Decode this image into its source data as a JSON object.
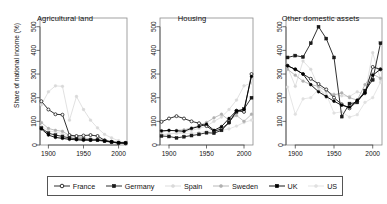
{
  "figure": {
    "ylabel": "Share of national income (%)",
    "y_ticks": [
      "0",
      "100",
      "200",
      "300",
      "400",
      "500"
    ],
    "x_ticks": [
      "1900",
      "1950",
      "2000"
    ],
    "background": "#ffffff"
  },
  "legend": {
    "items": [
      {
        "label": "France",
        "marker": "open-circle",
        "color": "#1a1a1a",
        "key_name": "legend-key-france"
      },
      {
        "label": "Germany",
        "marker": "filled-square",
        "color": "#1a1a1a",
        "key_name": "legend-key-germany"
      },
      {
        "label": "Spain",
        "marker": "filled-circle",
        "color": "#d9d9d9",
        "key_name": "legend-key-spain"
      },
      {
        "label": "Sweden",
        "marker": "filled-circle",
        "color": "#b0b0b0",
        "key_name": "legend-key-sweden"
      },
      {
        "label": "UK",
        "marker": "filled-square",
        "color": "#000000",
        "key_name": "legend-key-uk"
      },
      {
        "label": "US",
        "marker": "filled-circle",
        "color": "#e0e0e0",
        "key_name": "legend-key-us"
      }
    ]
  },
  "chart_data": {
    "type": "line",
    "xlabel": "",
    "ylabel": "Share of national income (%)",
    "xlim": [
      1888,
      2012
    ],
    "ylim": [
      0,
      520
    ],
    "xticks": [
      1900,
      1950,
      2000
    ],
    "yticks": [
      0,
      100,
      200,
      300,
      400,
      500
    ],
    "grid": false,
    "legend_position": "bottom",
    "panels": [
      {
        "title": "Agricultural land",
        "series": [
          {
            "name": "France",
            "color": "#1a1a1a",
            "marker": "open-circle",
            "x": [
              1890,
              1900,
              1910,
              1920,
              1930,
              1940,
              1950,
              1960,
              1970,
              1980,
              1990,
              2000,
              2010
            ],
            "y": [
              185,
              150,
              130,
              128,
              42,
              38,
              40,
              42,
              38,
              20,
              12,
              8,
              7
            ]
          },
          {
            "name": "Germany",
            "color": "#1a1a1a",
            "marker": "filled-square",
            "x": [
              1890,
              1900,
              1910,
              1920,
              1930,
              1940,
              1950,
              1960,
              1970,
              1980,
              1990,
              2000,
              2010
            ],
            "y": [
              72,
              50,
              42,
              36,
              30,
              26,
              24,
              22,
              20,
              16,
              12,
              9,
              8
            ]
          },
          {
            "name": "Spain",
            "color": "#d9d9d9",
            "marker": "filled-circle",
            "x": [
              1890,
              1900,
              1910,
              1920,
              1930,
              1940,
              1950,
              1960,
              1970,
              1980,
              1990,
              2000,
              2010
            ],
            "y": [
              170,
              225,
              250,
              248,
              105,
              205,
              150,
              105,
              72,
              45,
              30,
              18,
              12
            ]
          },
          {
            "name": "Sweden",
            "color": "#b0b0b0",
            "marker": "filled-circle",
            "x": [
              1890,
              1900,
              1910,
              1920,
              1930,
              1940,
              1950,
              1960,
              1970,
              1980,
              1990,
              2000,
              2010
            ],
            "y": [
              95,
              70,
              62,
              58,
              40,
              34,
              30,
              26,
              22,
              18,
              14,
              10,
              9
            ]
          },
          {
            "name": "UK",
            "color": "#000000",
            "marker": "filled-circle",
            "x": [
              1890,
              1900,
              1910,
              1920,
              1930,
              1940,
              1950,
              1960,
              1970,
              1980,
              1990,
              2000,
              2010
            ],
            "y": [
              68,
              42,
              32,
              28,
              24,
              22,
              20,
              20,
              22,
              18,
              14,
              10,
              9
            ]
          },
          {
            "name": "US",
            "color": "#e0e0e0",
            "marker": "filled-circle",
            "x": [
              1890,
              1900,
              1910,
              1920,
              1930,
              1940,
              1950,
              1960,
              1970,
              1980,
              1990,
              2000,
              2010
            ],
            "y": [
              80,
              60,
              55,
              48,
              36,
              30,
              28,
              26,
              24,
              22,
              16,
              12,
              10
            ]
          }
        ]
      },
      {
        "title": "Housing",
        "series": [
          {
            "name": "France",
            "color": "#1a1a1a",
            "marker": "open-circle",
            "x": [
              1890,
              1900,
              1910,
              1920,
              1930,
              1940,
              1950,
              1960,
              1970,
              1980,
              1990,
              2000,
              2010
            ],
            "y": [
              98,
              112,
              122,
              112,
              100,
              92,
              80,
              58,
              68,
              95,
              145,
              140,
              300
            ]
          },
          {
            "name": "Germany",
            "color": "#1a1a1a",
            "marker": "filled-square",
            "x": [
              1890,
              1900,
              1910,
              1920,
              1930,
              1940,
              1950,
              1960,
              1970,
              1980,
              1990,
              2000,
              2010
            ],
            "y": [
              38,
              36,
              30,
              35,
              40,
              45,
              52,
              50,
              62,
              95,
              140,
              152,
              200
            ]
          },
          {
            "name": "Spain",
            "color": "#d9d9d9",
            "marker": "filled-circle",
            "x": [
              1890,
              1900,
              1910,
              1920,
              1930,
              1940,
              1950,
              1960,
              1970,
              1980,
              1990,
              2000,
              2010
            ],
            "y": [
              42,
              46,
              50,
              55,
              62,
              70,
              80,
              100,
              118,
              150,
              190,
              250,
              262
            ]
          },
          {
            "name": "Sweden",
            "color": "#b0b0b0",
            "marker": "filled-circle",
            "x": [
              1890,
              1900,
              1910,
              1920,
              1930,
              1940,
              1950,
              1960,
              1970,
              1980,
              1990,
              2000,
              2010
            ],
            "y": [
              55,
              60,
              62,
              64,
              72,
              82,
              95,
              115,
              130,
              105,
              125,
              100,
              130
            ]
          },
          {
            "name": "UK",
            "color": "#000000",
            "marker": "filled-circle",
            "x": [
              1890,
              1900,
              1910,
              1920,
              1930,
              1940,
              1950,
              1960,
              1970,
              1980,
              1990,
              2000,
              2010
            ],
            "y": [
              60,
              62,
              60,
              58,
              70,
              78,
              88,
              62,
              78,
              112,
              145,
              150,
              290
            ]
          },
          {
            "name": "US",
            "color": "#e0e0e0",
            "marker": "filled-circle",
            "x": [
              1890,
              1900,
              1910,
              1920,
              1930,
              1940,
              1950,
              1960,
              1970,
              1980,
              1990,
              2000,
              2010
            ],
            "y": [
              45,
              48,
              50,
              48,
              50,
              52,
              58,
              60,
              62,
              68,
              80,
              95,
              105
            ]
          }
        ]
      },
      {
        "title": "Other domestic assets",
        "series": [
          {
            "name": "France",
            "color": "#1a1a1a",
            "marker": "open-circle",
            "x": [
              1890,
              1900,
              1910,
              1920,
              1930,
              1940,
              1950,
              1960,
              1970,
              1980,
              1990,
              2000,
              2010
            ],
            "y": [
              335,
              320,
              300,
              280,
              258,
              235,
              200,
              172,
              155,
              185,
              220,
              330,
              320
            ]
          },
          {
            "name": "Germany",
            "color": "#1a1a1a",
            "marker": "filled-square",
            "x": [
              1890,
              1900,
              1910,
              1920,
              1930,
              1940,
              1950,
              1960,
              1970,
              1980,
              1990,
              2000,
              2010
            ],
            "y": [
              370,
              378,
              372,
              430,
              500,
              450,
              370,
              120,
              175,
              180,
              230,
              275,
              430
            ]
          },
          {
            "name": "Spain",
            "color": "#d9d9d9",
            "marker": "filled-circle",
            "x": [
              1890,
              1900,
              1910,
              1920,
              1930,
              1940,
              1950,
              1960,
              1970,
              1980,
              1990,
              2000,
              2010
            ],
            "y": [
              330,
              248,
              355,
              320,
              245,
              200,
              215,
              208,
              205,
              225,
              215,
              390,
              278
            ]
          },
          {
            "name": "Sweden",
            "color": "#b0b0b0",
            "marker": "filled-circle",
            "x": [
              1890,
              1900,
              1910,
              1920,
              1930,
              1940,
              1950,
              1960,
              1970,
              1980,
              1990,
              2000,
              2010
            ],
            "y": [
              320,
              295,
              270,
              255,
              248,
              228,
              212,
              220,
              200,
              190,
              255,
              300,
              282
            ]
          },
          {
            "name": "UK",
            "color": "#000000",
            "marker": "filled-circle",
            "x": [
              1890,
              1900,
              1910,
              1920,
              1930,
              1940,
              1950,
              1960,
              1970,
              1980,
              1990,
              2000,
              2010
            ],
            "y": [
              335,
              320,
              300,
              255,
              225,
              205,
              185,
              168,
              160,
              190,
              220,
              295,
              320
            ]
          },
          {
            "name": "US",
            "color": "#e0e0e0",
            "marker": "filled-circle",
            "x": [
              1890,
              1900,
              1910,
              1920,
              1930,
              1940,
              1950,
              1960,
              1970,
              1980,
              1990,
              2000,
              2010
            ],
            "y": [
              245,
              130,
              195,
              200,
              235,
              215,
              135,
              140,
              118,
              128,
              180,
              200,
              265
            ]
          }
        ]
      }
    ]
  }
}
